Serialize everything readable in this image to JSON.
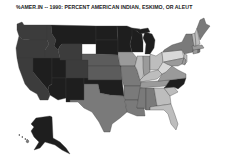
{
  "title": "%AMER.IN -- 1990: PERCENT AMERICAN INDIAN, ESKIMO, OR ALEUT",
  "map": {
    "type": "choropleth",
    "region": "United States",
    "variable": "Percent American Indian, Eskimo, or Aleut",
    "year": 1990,
    "shade_classes": {
      "darkest": "#1e1e1e",
      "dark": "#3c3c3c",
      "medium_dark": "#5c5c5c",
      "medium": "#7a7a7a",
      "medium_light": "#9a9a9a",
      "light": "#bdbdbd",
      "lightest": "#d8d8d8"
    },
    "states": [
      {
        "id": "WA",
        "name": "Washington",
        "shade": "dark"
      },
      {
        "id": "OR",
        "name": "Oregon",
        "shade": "dark"
      },
      {
        "id": "CA",
        "name": "California",
        "shade": "dark"
      },
      {
        "id": "ID",
        "name": "Idaho",
        "shade": "dark"
      },
      {
        "id": "NV",
        "name": "Nevada",
        "shade": "darkest"
      },
      {
        "id": "MT",
        "name": "Montana",
        "shade": "darkest"
      },
      {
        "id": "WY",
        "name": "Wyoming",
        "shade": "dark"
      },
      {
        "id": "UT",
        "name": "Utah",
        "shade": "darkest"
      },
      {
        "id": "AZ",
        "name": "Arizona",
        "shade": "darkest"
      },
      {
        "id": "CO",
        "name": "Colorado",
        "shade": "dark"
      },
      {
        "id": "NM",
        "name": "New Mexico",
        "shade": "darkest"
      },
      {
        "id": "ND",
        "name": "North Dakota",
        "shade": "darkest"
      },
      {
        "id": "SD",
        "name": "South Dakota",
        "shade": "darkest"
      },
      {
        "id": "NE",
        "name": "Nebraska",
        "shade": "medium_dark"
      },
      {
        "id": "KS",
        "name": "Kansas",
        "shade": "medium_dark"
      },
      {
        "id": "OK",
        "name": "Oklahoma",
        "shade": "darkest"
      },
      {
        "id": "TX",
        "name": "Texas",
        "shade": "medium"
      },
      {
        "id": "MN",
        "name": "Minnesota",
        "shade": "darkest"
      },
      {
        "id": "IA",
        "name": "Iowa",
        "shade": "medium_light"
      },
      {
        "id": "MO",
        "name": "Missouri",
        "shade": "medium"
      },
      {
        "id": "AR",
        "name": "Arkansas",
        "shade": "medium"
      },
      {
        "id": "LA",
        "name": "Louisiana",
        "shade": "medium"
      },
      {
        "id": "WI",
        "name": "Wisconsin",
        "shade": "darkest"
      },
      {
        "id": "MI",
        "name": "Michigan",
        "shade": "darkest"
      },
      {
        "id": "IL",
        "name": "Illinois",
        "shade": "light"
      },
      {
        "id": "IN",
        "name": "Indiana",
        "shade": "medium_light"
      },
      {
        "id": "OH",
        "name": "Ohio",
        "shade": "light"
      },
      {
        "id": "KY",
        "name": "Kentucky",
        "shade": "light"
      },
      {
        "id": "TN",
        "name": "Tennessee",
        "shade": "medium_light"
      },
      {
        "id": "MS",
        "name": "Mississippi",
        "shade": "medium"
      },
      {
        "id": "AL",
        "name": "Alabama",
        "shade": "medium"
      },
      {
        "id": "GA",
        "name": "Georgia",
        "shade": "light"
      },
      {
        "id": "FL",
        "name": "Florida",
        "shade": "light"
      },
      {
        "id": "SC",
        "name": "South Carolina",
        "shade": "light"
      },
      {
        "id": "NC",
        "name": "North Carolina",
        "shade": "darkest"
      },
      {
        "id": "VA",
        "name": "Virginia",
        "shade": "medium_light"
      },
      {
        "id": "WV",
        "name": "West Virginia",
        "shade": "lightest"
      },
      {
        "id": "PA",
        "name": "Pennsylvania",
        "shade": "lightest"
      },
      {
        "id": "NY",
        "name": "New York",
        "shade": "medium"
      },
      {
        "id": "MD",
        "name": "Maryland",
        "shade": "medium_light"
      },
      {
        "id": "DE",
        "name": "Delaware",
        "shade": "medium_light"
      },
      {
        "id": "NJ",
        "name": "New Jersey",
        "shade": "light"
      },
      {
        "id": "CT",
        "name": "Connecticut",
        "shade": "medium_light"
      },
      {
        "id": "RI",
        "name": "Rhode Island",
        "shade": "medium"
      },
      {
        "id": "MA",
        "name": "Massachusetts",
        "shade": "medium_light"
      },
      {
        "id": "VT",
        "name": "Vermont",
        "shade": "light"
      },
      {
        "id": "NH",
        "name": "New Hampshire",
        "shade": "light"
      },
      {
        "id": "ME",
        "name": "Maine",
        "shade": "medium"
      },
      {
        "id": "AK",
        "name": "Alaska",
        "shade": "darkest"
      },
      {
        "id": "HI",
        "name": "Hawaii",
        "shade": "medium"
      }
    ]
  }
}
